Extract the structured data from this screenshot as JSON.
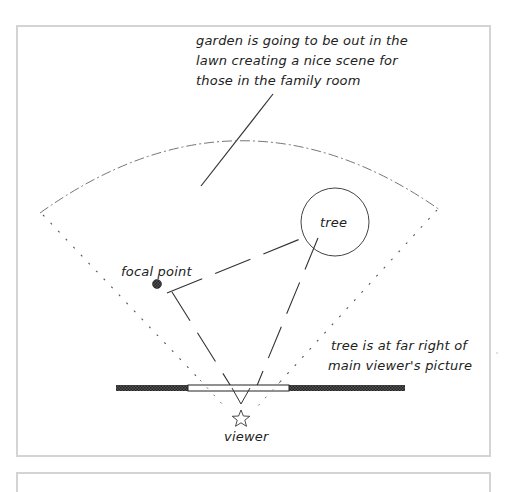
{
  "diagram": {
    "annotations": {
      "garden_note": [
        "garden is going to be out in the",
        "lawn creating a nice scene for",
        "those in the family room"
      ],
      "tree_label": "tree",
      "focal_point_label": "focal point",
      "tree_note": [
        "tree is at far right of",
        "main viewer's picture"
      ],
      "viewer_label": "viewer"
    },
    "colors": {
      "line": "#333333",
      "frame": "#d4d4d4",
      "wall": "#2a2a2a",
      "window": "#ffffff"
    }
  }
}
